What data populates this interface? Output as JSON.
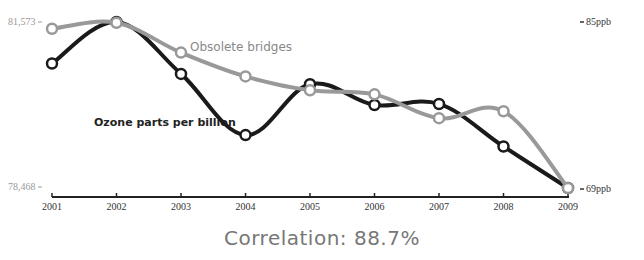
{
  "chart_data": {
    "type": "line",
    "title": "",
    "categories": [
      "2001",
      "2002",
      "2003",
      "2004",
      "2005",
      "2006",
      "2007",
      "2008",
      "2009"
    ],
    "series": [
      {
        "name": "Obsolete bridges",
        "axis": "left",
        "color": "#999999",
        "values": [
          81447,
          81559,
          81001,
          80555,
          80295,
          80220,
          79774,
          79904,
          78468
        ]
      },
      {
        "name": "Ozone parts per billion",
        "axis": "right",
        "color": "#1a1a1a",
        "values": [
          81.0,
          85.0,
          80.0,
          74.1,
          79.0,
          77.0,
          77.1,
          73.0,
          69.0
        ]
      }
    ],
    "left_axis": {
      "min_label": "78,468",
      "max_label": "81,573",
      "ylim": [
        78468,
        81573
      ]
    },
    "right_axis": {
      "min_label": "69ppb",
      "max_label": "85ppb",
      "ylim": [
        69,
        85
      ]
    },
    "xlabel": "",
    "ylabel": "",
    "grid": false,
    "legend": "inline labels",
    "annotation": "Correlation: 88.7%"
  },
  "labels": {
    "left_max": "81,573",
    "left_min": "78,468",
    "right_max": "85ppb",
    "right_min": "69ppb",
    "series_gray": "Obsolete bridges",
    "series_black": "Ozone parts per billion",
    "footer": "Correlation: 88.7%"
  }
}
